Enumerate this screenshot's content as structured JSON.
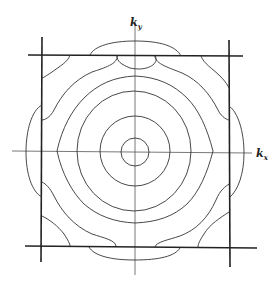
{
  "diagram": {
    "type": "k-space constant-energy contours with Brillouin zone boundary",
    "axes": {
      "x_label": "k",
      "x_sub": "x",
      "y_label": "k",
      "y_sub": "y"
    },
    "center": [
      135,
      151
    ],
    "circle_radii": [
      14,
      35,
      57,
      77
    ],
    "zone_boundary": {
      "left": 41,
      "right": 229,
      "top": 55,
      "bottom": 247
    },
    "colors": {
      "line": "#333333",
      "axis": "#555555",
      "background": "#ffffff"
    }
  }
}
